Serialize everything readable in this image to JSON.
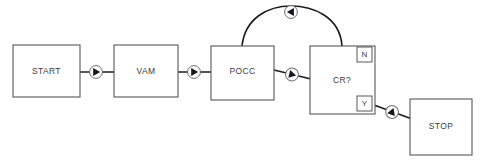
{
  "diagram": {
    "type": "flowchart",
    "background_color": "#ffffff",
    "node_stroke_color": "#58585a",
    "edge_color": "#1c1c1c",
    "text_color": "#3b3b3d",
    "nodes": [
      {
        "id": "start",
        "label": "START",
        "shape": "rectangle",
        "x": 13,
        "y": 45,
        "w": 67,
        "h": 52
      },
      {
        "id": "vam",
        "label": "VAM",
        "shape": "rectangle",
        "x": 114,
        "y": 45,
        "w": 64,
        "h": 52
      },
      {
        "id": "pocc",
        "label": "POCC",
        "shape": "rectangle",
        "x": 211,
        "y": 46,
        "w": 63,
        "h": 54
      },
      {
        "id": "cr",
        "label": "CR?",
        "shape": "rectangle",
        "x": 310,
        "y": 46,
        "w": 65,
        "h": 68
      },
      {
        "id": "stop",
        "label": "STOP",
        "shape": "rectangle",
        "x": 410,
        "y": 99,
        "w": 62,
        "h": 56
      }
    ],
    "branch_labels": [
      {
        "id": "branch-n",
        "label": "N",
        "x": 357,
        "y": 47,
        "w": 15,
        "h": 15
      },
      {
        "id": "branch-y",
        "label": "Y",
        "x": 357,
        "y": 96,
        "w": 15,
        "h": 15
      }
    ],
    "edges": [
      {
        "id": "start-to-vam",
        "from": "START",
        "to": "VAM",
        "marker": "circled-triangle-right"
      },
      {
        "id": "vam-to-pocc",
        "from": "VAM",
        "to": "POCC",
        "marker": "circled-triangle-right"
      },
      {
        "id": "pocc-to-cr",
        "from": "POCC",
        "to": "CR?",
        "marker": "circled-triangle-right"
      },
      {
        "id": "cr-n-to-pocc",
        "from": "CR?",
        "to": "POCC",
        "label": "N",
        "marker": "circled-triangle-left",
        "style": "arc"
      },
      {
        "id": "cr-y-to-stop",
        "from": "CR?",
        "to": "STOP",
        "label": "Y",
        "marker": "circled-triangle-up-right"
      }
    ]
  }
}
